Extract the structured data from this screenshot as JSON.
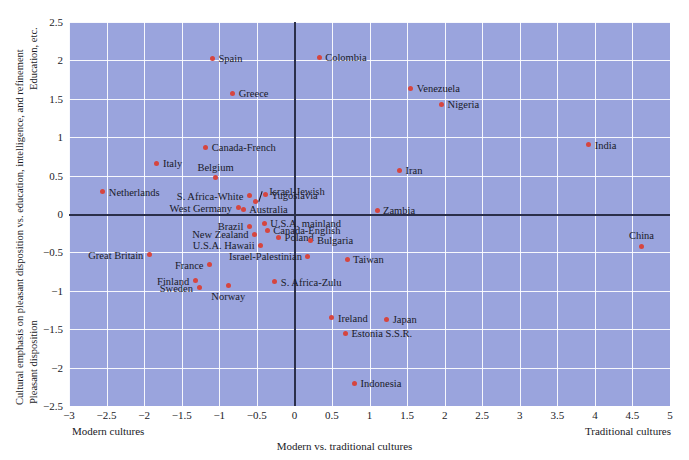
{
  "axes": {
    "x_title": "Modern vs. traditional cultures",
    "x_left_caption": "Modern cultures",
    "x_right_caption": "Traditional cultures",
    "y_title_main": "Cultural emphasis on pleasant disposition vs. education, intelligence, and refinement",
    "y_top_caption": "Education, etc.",
    "y_bottom_caption": "Pleasant disposition",
    "x_ticks": [
      "-3",
      "-2.5",
      "-2",
      "-1.5",
      "-1",
      "-0.5",
      "0",
      "0.5",
      "1",
      "1.5",
      "2",
      "2.5",
      "3",
      "3.5",
      "4",
      "4.5",
      "5"
    ],
    "y_ticks": [
      "2.5",
      "2",
      "1.5",
      "1",
      "0.5",
      "0",
      "-0.5",
      "-1",
      "-1.5",
      "-2",
      "-2.5"
    ]
  },
  "chart_data": {
    "type": "scatter",
    "title": "",
    "xlabel": "Modern vs. traditional cultures",
    "ylabel": "Cultural emphasis on pleasant disposition vs. education, intelligence, and refinement",
    "xlim": [
      -3,
      5
    ],
    "ylim": [
      -2.5,
      2.5
    ],
    "grid": true,
    "legend": "none",
    "marker_color": "#d6453f",
    "panel_color": "#9aa4dd",
    "grid_color": "#ffffff",
    "axis_color": "#2b2f4a",
    "points": [
      {
        "name": "Spain",
        "x": -1.09,
        "y": 2.03,
        "side": "r"
      },
      {
        "name": "Colombia",
        "x": 0.33,
        "y": 2.04,
        "side": "r"
      },
      {
        "name": "Greece",
        "x": -0.82,
        "y": 1.57,
        "side": "r"
      },
      {
        "name": "Venezuela",
        "x": 1.55,
        "y": 1.64,
        "side": "r"
      },
      {
        "name": "Nigeria",
        "x": 1.96,
        "y": 1.43,
        "side": "r"
      },
      {
        "name": "India",
        "x": 3.92,
        "y": 0.9,
        "side": "r"
      },
      {
        "name": "Canada-French",
        "x": -1.18,
        "y": 0.87,
        "side": "r"
      },
      {
        "name": "Italy",
        "x": -1.83,
        "y": 0.66,
        "side": "r"
      },
      {
        "name": "Iran",
        "x": 1.4,
        "y": 0.57,
        "side": "r"
      },
      {
        "name": "Belgium",
        "x": -1.05,
        "y": 0.47,
        "side": "up"
      },
      {
        "name": "Israel-Jewish",
        "x": -0.52,
        "y": 0.16,
        "side": "leader"
      },
      {
        "name": "Yugosiavia",
        "x": -0.39,
        "y": 0.25,
        "side": "r"
      },
      {
        "name": "Netherlands",
        "x": -2.55,
        "y": 0.29,
        "side": "r"
      },
      {
        "name": "S. Africa-White",
        "x": -0.6,
        "y": 0.24,
        "side": "l"
      },
      {
        "name": "West Germany",
        "x": -0.75,
        "y": 0.08,
        "side": "l"
      },
      {
        "name": "Australia",
        "x": -0.68,
        "y": 0.06,
        "side": "r"
      },
      {
        "name": "Zambia",
        "x": 1.1,
        "y": 0.05,
        "side": "r"
      },
      {
        "name": "Brazil",
        "x": -0.6,
        "y": -0.16,
        "side": "l"
      },
      {
        "name": "U.S.A. mainland",
        "x": -0.4,
        "y": -0.12,
        "side": "r"
      },
      {
        "name": "Canada-English",
        "x": -0.36,
        "y": -0.21,
        "side": "r"
      },
      {
        "name": "New Zealand",
        "x": -0.53,
        "y": -0.26,
        "side": "l"
      },
      {
        "name": "Poland",
        "x": -0.21,
        "y": -0.3,
        "side": "r"
      },
      {
        "name": "Bulgaria",
        "x": 0.22,
        "y": -0.34,
        "side": "r"
      },
      {
        "name": "China",
        "x": 4.62,
        "y": -0.42,
        "side": "up"
      },
      {
        "name": "U.S.A. Hawaii",
        "x": -0.45,
        "y": -0.41,
        "side": "l"
      },
      {
        "name": "Great Britain",
        "x": -1.93,
        "y": -0.53,
        "side": "l"
      },
      {
        "name": "Israel-Palestinian",
        "x": 0.18,
        "y": -0.55,
        "side": "l"
      },
      {
        "name": "Taiwan",
        "x": 0.7,
        "y": -0.59,
        "side": "r"
      },
      {
        "name": "France",
        "x": -1.13,
        "y": -0.66,
        "side": "l"
      },
      {
        "name": "Finland",
        "x": -1.32,
        "y": -0.87,
        "side": "l"
      },
      {
        "name": "S. Africa-Zulu",
        "x": -0.26,
        "y": -0.88,
        "side": "r"
      },
      {
        "name": "Sweden",
        "x": -1.27,
        "y": -0.96,
        "side": "l"
      },
      {
        "name": "Norway",
        "x": -0.88,
        "y": -0.93,
        "side": "d"
      },
      {
        "name": "Ireland",
        "x": 0.5,
        "y": -1.35,
        "side": "r"
      },
      {
        "name": "Japan",
        "x": 1.23,
        "y": -1.37,
        "side": "r"
      },
      {
        "name": "Estonia S.S.R.",
        "x": 0.68,
        "y": -1.55,
        "side": "r"
      },
      {
        "name": "Indonesia",
        "x": 0.8,
        "y": -2.2,
        "side": "r"
      }
    ]
  }
}
